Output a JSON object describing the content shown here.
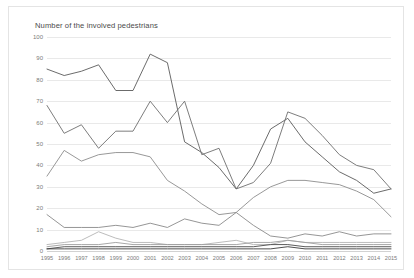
{
  "chart_data": {
    "type": "line",
    "title": "Number of the involved pedestrians",
    "xlabel": "",
    "ylabel": "",
    "ylim": [
      0,
      100
    ],
    "yticks": [
      0,
      10,
      20,
      30,
      40,
      50,
      60,
      70,
      80,
      90,
      100
    ],
    "grid": "horizontal",
    "legend": "none",
    "categories": [
      "1995",
      "1996",
      "1997",
      "1998",
      "1999",
      "2000",
      "2001",
      "2002",
      "2003",
      "2004",
      "2005",
      "2006",
      "2007",
      "2008",
      "2009",
      "2010",
      "2011",
      "2012",
      "2013",
      "2014",
      "2015"
    ],
    "series": [
      {
        "name": "series-1",
        "color": "#5a5a5a",
        "values": [
          85,
          82,
          84,
          87,
          75,
          75,
          92,
          88,
          51,
          46,
          39,
          29,
          40,
          57,
          62,
          51,
          44,
          37,
          33,
          27,
          29
        ]
      },
      {
        "name": "series-2",
        "color": "#6e6e6e",
        "values": [
          68,
          55,
          59,
          48,
          56,
          56,
          70,
          60,
          70,
          45,
          48,
          29,
          32,
          41,
          65,
          62,
          54,
          45,
          40,
          38,
          29
        ]
      },
      {
        "name": "series-3",
        "color": "#8c8c8c",
        "values": [
          35,
          47,
          42,
          45,
          46,
          46,
          44,
          33,
          28,
          22,
          17,
          18,
          25,
          30,
          33,
          33,
          32,
          31,
          28,
          24,
          16
        ]
      },
      {
        "name": "series-4",
        "color": "#8a8a8a",
        "values": [
          17,
          11,
          11,
          11,
          12,
          11,
          13,
          11,
          15,
          13,
          12,
          18,
          12,
          7,
          6,
          8,
          7,
          9,
          7,
          8,
          8
        ]
      },
      {
        "name": "series-5",
        "color": "#b4b4b4",
        "values": [
          3,
          4,
          5,
          9,
          6,
          4,
          4,
          3,
          3,
          3,
          4,
          5,
          3,
          3,
          5,
          4,
          4,
          4,
          4,
          4,
          4
        ]
      },
      {
        "name": "series-6",
        "color": "#9e9e9e",
        "values": [
          2,
          3,
          3,
          3,
          4,
          3,
          3,
          3,
          3,
          3,
          3,
          3,
          4,
          4,
          5,
          4,
          3,
          3,
          3,
          3,
          3
        ]
      },
      {
        "name": "series-7",
        "color": "#4a4a4a",
        "values": [
          1,
          2,
          2,
          2,
          2,
          2,
          2,
          2,
          2,
          2,
          2,
          2,
          2,
          3,
          3,
          2,
          2,
          2,
          2,
          2,
          2
        ]
      },
      {
        "name": "series-8",
        "color": "#3c3c3c",
        "values": [
          1,
          1,
          1,
          1,
          1,
          1,
          1,
          1,
          1,
          1,
          1,
          1,
          1,
          1,
          2,
          1,
          1,
          1,
          1,
          1,
          1
        ]
      }
    ]
  }
}
